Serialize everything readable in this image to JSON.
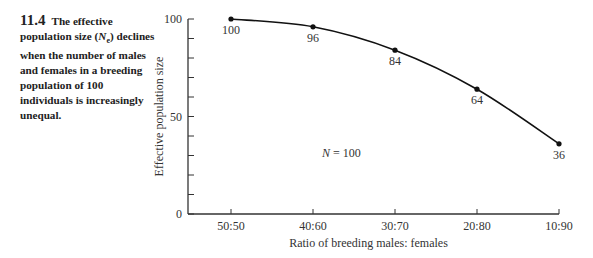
{
  "caption": {
    "figure_number": "11.4",
    "text_before_symbol": "The effective population size (",
    "symbol": "N",
    "symbol_sub": "e",
    "text_after_symbol": ") declines when the number of males and females in a breeding population of 100 individuals is increasingly unequal."
  },
  "annotation": {
    "label": "N",
    "value": "= 100"
  },
  "chart_data": {
    "type": "line",
    "title": "",
    "xlabel": "Ratio of breeding males: females",
    "ylabel": "Effective population size",
    "categories": [
      "50:50",
      "40:60",
      "30:70",
      "20:80",
      "10:90"
    ],
    "values": [
      100,
      96,
      84,
      64,
      36
    ],
    "data_labels": [
      "100",
      "96",
      "84",
      "64",
      "36"
    ],
    "ylim": [
      0,
      100
    ],
    "yticks_labeled": [
      0,
      50,
      100
    ],
    "yticks_minor_step": 10,
    "grid": false,
    "legend": null,
    "annotations": [
      "N = 100"
    ]
  }
}
